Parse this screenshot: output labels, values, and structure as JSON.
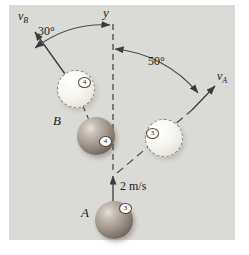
{
  "colors": {
    "panel_background": "#dadad6",
    "page_background": "#ffffff",
    "line": "#3c3c3a",
    "text": "#1c1c1c",
    "solid_ball_dark": "#453c34",
    "solid_ball_light": "#e6e1db",
    "ghost_ball": "#f8f6f1"
  },
  "axis": {
    "y_label": "y"
  },
  "vectors": {
    "vB": {
      "symbol": "v",
      "subscript": "B"
    },
    "vA": {
      "symbol": "v",
      "subscript": "A"
    },
    "initial_speed": "2 m/s"
  },
  "angles": {
    "left_of_axis": "30°",
    "right_of_axis": "50°"
  },
  "balls": {
    "A": {
      "label": "A",
      "number": "3"
    },
    "B": {
      "label": "B",
      "number": "4"
    },
    "A_final": {
      "number": "3"
    },
    "B_final": {
      "number": "4"
    }
  }
}
